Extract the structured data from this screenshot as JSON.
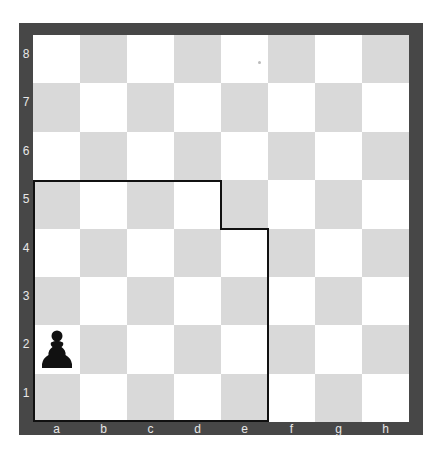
{
  "board": {
    "ranks": [
      "8",
      "7",
      "6",
      "5",
      "4",
      "3",
      "2",
      "1"
    ],
    "files": [
      "a",
      "b",
      "c",
      "d",
      "e",
      "f",
      "g",
      "h"
    ],
    "colors": {
      "frame": "#474747",
      "light_square": "#ffffff",
      "dark_square": "#d9d9d9",
      "label": "#e8e8e8",
      "outline": "#111111",
      "piece": "#111111"
    },
    "pieces": [
      {
        "square": "a2",
        "type": "pawn",
        "color": "black",
        "glyph": "♟"
      }
    ],
    "highlight_region": {
      "description": "outlined region",
      "squares": [
        "a1",
        "b1",
        "c1",
        "d1",
        "e1",
        "a2",
        "b2",
        "c2",
        "d2",
        "e2",
        "a3",
        "b3",
        "c3",
        "d3",
        "e3",
        "a4",
        "b4",
        "c4",
        "d4",
        "e4",
        "a5",
        "b5",
        "c5",
        "d5"
      ]
    }
  }
}
